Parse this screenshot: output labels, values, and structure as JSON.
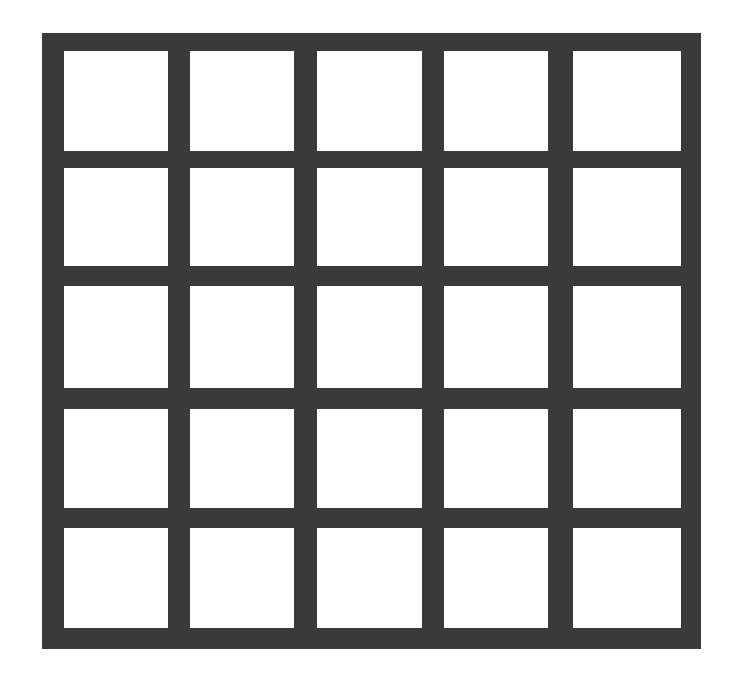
{
  "diagram": {
    "type": "grid",
    "rows": 5,
    "columns": 5,
    "colors": {
      "background": "#ffffff",
      "frame": "#3a3a3a",
      "cell": "#ffffff"
    },
    "frame": {
      "x": 42,
      "y": 33,
      "w": 659,
      "h": 616
    },
    "column_edges": [
      [
        64,
        168
      ],
      [
        190,
        294
      ],
      [
        317,
        422
      ],
      [
        444,
        548
      ],
      [
        573,
        681
      ]
    ],
    "row_edges": [
      [
        51,
        151
      ],
      [
        168,
        266
      ],
      [
        286,
        388
      ],
      [
        409,
        508
      ],
      [
        528,
        628
      ]
    ]
  }
}
